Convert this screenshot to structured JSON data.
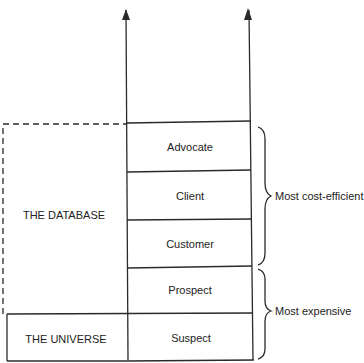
{
  "diagram": {
    "ladder_rungs": [
      {
        "label": "Advocate"
      },
      {
        "label": "Client"
      },
      {
        "label": "Customer"
      },
      {
        "label": "Prospect"
      },
      {
        "label": "Suspect"
      }
    ],
    "regions": {
      "database": "THE DATABASE",
      "universe": "THE UNIVERSE"
    },
    "brackets": {
      "upper": "Most cost-efficient",
      "lower": "Most expensive"
    },
    "colors": {
      "line": "#2a2a2a",
      "background": "#ffffff"
    }
  }
}
